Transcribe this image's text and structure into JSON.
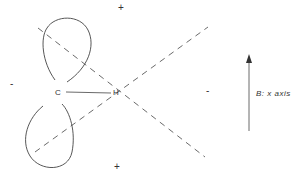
{
  "diagram": {
    "type": "orbital-overlap-diagram",
    "atoms": [
      {
        "symbol": "C",
        "x": 58,
        "y": 93
      },
      {
        "symbol": "H",
        "x": 117,
        "y": 93
      }
    ],
    "bond": {
      "from": "C",
      "to": "H"
    },
    "signs": {
      "top": "+",
      "bottom": "+",
      "left": "-",
      "right": "-"
    },
    "field_label": {
      "text": "B: x axis",
      "symbol": "B",
      "axis_text": "x axis"
    },
    "colors": {
      "ink": "#333333",
      "background": "#ffffff"
    }
  }
}
